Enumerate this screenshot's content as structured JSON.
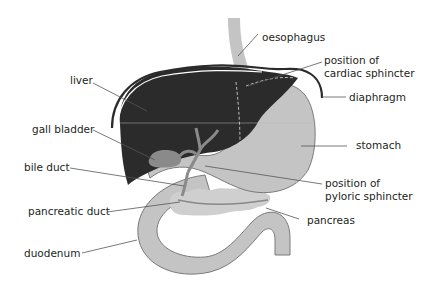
{
  "diagram": {
    "type": "anatomical-diagram",
    "colors": {
      "liver": "#2b2b2b",
      "organ_fill": "#c4c4c4",
      "organ_outline": "#7a7a7a",
      "gall_bladder": "#8a8a8a",
      "diaphragm": "#2b2b2b",
      "leader_line": "#555555",
      "text": "#231f20"
    },
    "labels": {
      "oesophagus": "oesophagus",
      "cardiac_line1": "position of",
      "cardiac_line2": "cardiac sphincter",
      "diaphragm": "diaphragm",
      "liver": "liver",
      "gall_bladder": "gall bladder",
      "stomach": "stomach",
      "bile_duct": "bile duct",
      "pyloric_line1": "position of",
      "pyloric_line2": "pyloric sphincter",
      "pancreatic_duct": "pancreatic duct",
      "pancreas": "pancreas",
      "duodenum": "duodenum"
    }
  }
}
